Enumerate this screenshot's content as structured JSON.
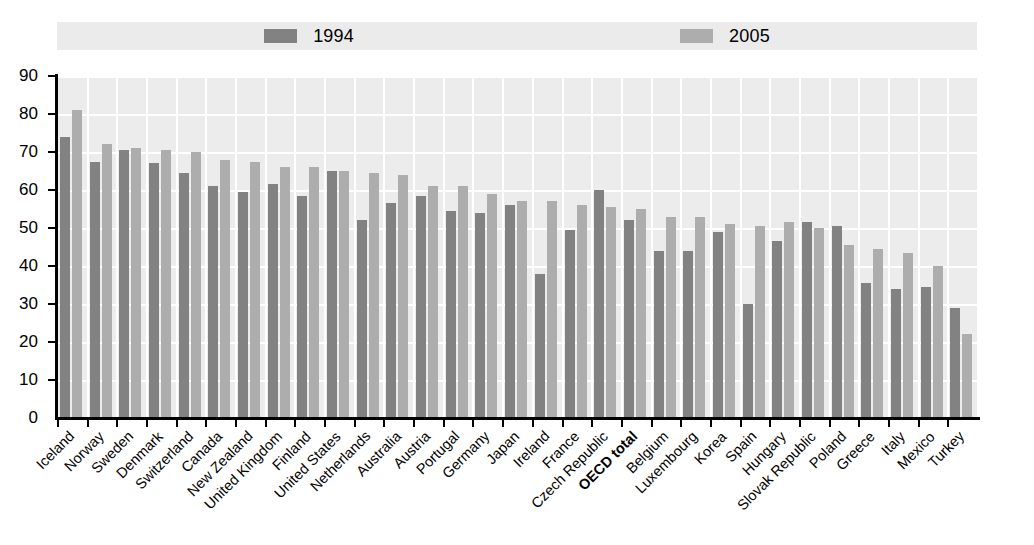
{
  "chart_data": {
    "type": "bar",
    "title": "",
    "subtitle": "",
    "xlabel": "",
    "ylabel": "",
    "ylim": [
      0,
      90
    ],
    "ytick_step": 10,
    "yticks": [
      0,
      10,
      20,
      30,
      40,
      50,
      60,
      70,
      80,
      90
    ],
    "grid": true,
    "grid_orientation": "both",
    "legend_position": "top-center",
    "legend": [
      "1994",
      "2005"
    ],
    "colors": {
      "series_1994": "#828282",
      "series_2005": "#adadad",
      "plot_background": "#ececec",
      "legend_background": "#ebebeb",
      "gridline": "#ffffff",
      "axis": "#000000"
    },
    "bold_categories": [
      "OECD total"
    ],
    "categories": [
      "Iceland",
      "Norway",
      "Sweden",
      "Denmark",
      "Switzerland",
      "Canada",
      "New Zealand",
      "United Kingdom",
      "Finland",
      "United States",
      "Netherlands",
      "Australia",
      "Austria",
      "Portugal",
      "Germany",
      "Japan",
      "Ireland",
      "France",
      "Czech Republic",
      "OECD total",
      "Belgium",
      "Luxembourg",
      "Korea",
      "Spain",
      "Hungary",
      "Slovak Republic",
      "Poland",
      "Greece",
      "Italy",
      "Mexico",
      "Turkey"
    ],
    "series": [
      {
        "name": "1994",
        "values": [
          74,
          67.5,
          70.5,
          67,
          64.5,
          61,
          59.5,
          61.5,
          58.5,
          65,
          52,
          56.5,
          58.5,
          54.5,
          54,
          56,
          38,
          49.5,
          60,
          52,
          44,
          44,
          49,
          30,
          46.5,
          51.5,
          50.5,
          35.5,
          34,
          34.5,
          29
        ]
      },
      {
        "name": "2005",
        "values": [
          81,
          72,
          71,
          70.5,
          70,
          68,
          67.5,
          66,
          66,
          65,
          64.5,
          64,
          61,
          61,
          59,
          57,
          57,
          56,
          55.5,
          55,
          53,
          53,
          51,
          50.5,
          51.5,
          50,
          45.5,
          44.5,
          43.5,
          40,
          22
        ]
      }
    ]
  }
}
